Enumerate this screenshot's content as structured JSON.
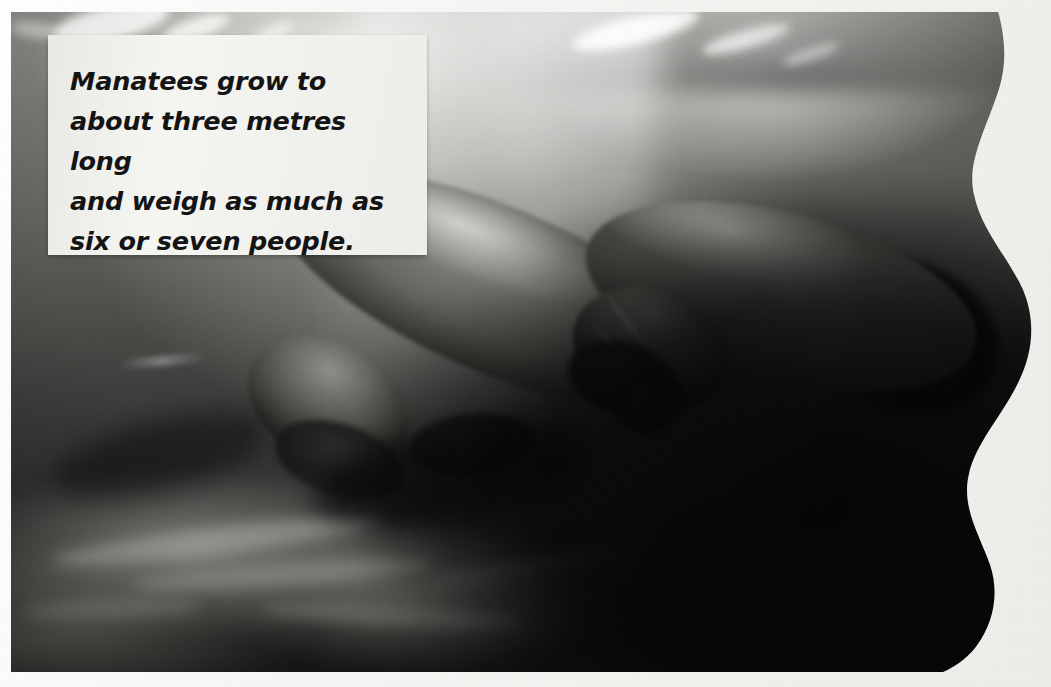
{
  "page": {
    "kind": "scanned-book-photo-page",
    "width": 1051,
    "height": 687,
    "background_color": "#ffffff"
  },
  "photograph": {
    "name": "underwater-manatees-photo",
    "subject": "Two manatees swimming underwater",
    "treatment": "black-and-white halftone print scan",
    "edge_style": "wavy torn right edge",
    "colors": {
      "highlight": "#f7f7f5",
      "midtone": "#7c7c78",
      "shadow": "#181817",
      "paper": "#f4f4f1"
    },
    "regions": [
      {
        "name": "water-surface-light",
        "label": "Sunlit water surface"
      },
      {
        "name": "light-shaft",
        "label": "Shaft of sunlight"
      },
      {
        "name": "manatee-rear",
        "label": "Rear manatee"
      },
      {
        "name": "manatee-front",
        "label": "Front manatee"
      },
      {
        "name": "river-bed",
        "label": "Rocky river bed"
      }
    ]
  },
  "caption": {
    "background_color": "#f4f4f1",
    "text_color": "#141414",
    "lines": [
      "Manatees grow to",
      "about three metres long",
      "and weigh as much as",
      "six or seven people."
    ],
    "full_text": "Manatees grow to about three metres long and weigh as much as six or seven people."
  }
}
